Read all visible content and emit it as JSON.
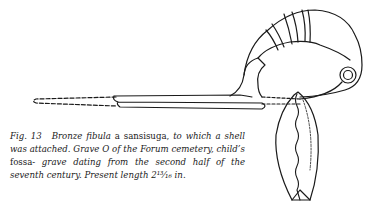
{
  "figure": {
    "colors": {
      "ink": "#1a1a1a",
      "paper": "#ffffff"
    }
  },
  "caption": {
    "label": "Fig. 13",
    "part1": "Bronze fibula",
    "part2": "a sansisuga,",
    "part3": "to which a shell was attached. Grave O of the Forum cemetery, child’s",
    "part4": "fossa-",
    "part5": "grave dating from the second half of the seventh century. Present length 2¹³⁄₁₆ in."
  }
}
